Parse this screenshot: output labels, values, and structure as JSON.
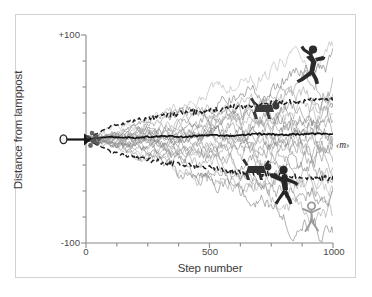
{
  "figure": {
    "border_color": "#d2d2d2",
    "background": "#ffffff"
  },
  "axes": {
    "y_label": "Distance from lamppost",
    "x_label": "Step number",
    "y_ticks": [
      "+100",
      "-100"
    ],
    "x_ticks": [
      "0",
      "500",
      "1000"
    ],
    "y_tick_values": [
      100,
      -100
    ],
    "x_tick_values": [
      0,
      500,
      1000
    ]
  },
  "annotations": {
    "mean_label": "‹m›"
  },
  "icons": {
    "lamppost": "lamppost-icon",
    "jumping_figure": "jumping-person-icon",
    "crawling_figure_upper": "crawling-person-icon",
    "crawling_figure_lower": "crawling-person-icon",
    "walking_figure": "walking-person-icon",
    "stick_figure": "stick-person-icon"
  },
  "caption": {
    "text": ""
  },
  "chart_data": {
    "type": "line",
    "title": "",
    "xlabel": "Step number",
    "ylabel": "Distance from lamppost",
    "xlim": [
      0,
      1000
    ],
    "ylim": [
      -100,
      100
    ],
    "grid": false,
    "legend": null,
    "x_ticks": [
      0,
      500,
      1000
    ],
    "y_ticks": [
      -100,
      100
    ],
    "y_minor_tick_interval": 25,
    "x_minor_tick_interval": 125,
    "series": [
      {
        "name": "mean",
        "style": "solid-black",
        "color": "#141414",
        "x": [
          0,
          100,
          200,
          300,
          400,
          500,
          600,
          700,
          800,
          900,
          1000
        ],
        "values": [
          0,
          2,
          1,
          3,
          2,
          4,
          3,
          5,
          4,
          5,
          5
        ]
      },
      {
        "name": "rms-envelope-upper",
        "style": "dashed-black",
        "color": "#1f1f1f",
        "x": [
          0,
          100,
          200,
          300,
          400,
          500,
          600,
          700,
          800,
          900,
          1000
        ],
        "values": [
          0,
          12,
          18,
          22,
          25,
          28,
          31,
          33,
          35,
          37,
          38
        ]
      },
      {
        "name": "rms-envelope-lower",
        "style": "dashed-black",
        "color": "#1f1f1f",
        "x": [
          0,
          100,
          200,
          300,
          400,
          500,
          600,
          700,
          800,
          900,
          1000
        ],
        "values": [
          0,
          -12,
          -18,
          -22,
          -25,
          -28,
          -31,
          -33,
          -35,
          -37,
          -38
        ]
      },
      {
        "name": "walk-ensemble",
        "style": "thin-gray",
        "color": "#8d8d8d",
        "count": 22,
        "endpoint_range": [
          -95,
          95
        ],
        "note": "individual random-walk trajectories, spread grows as sqrt(n)"
      }
    ],
    "walk_endpoints": [
      92,
      70,
      55,
      48,
      40,
      34,
      28,
      22,
      16,
      10,
      4,
      -3,
      -10,
      -16,
      -22,
      -30,
      -38,
      -46,
      -55,
      -64,
      -78,
      -90
    ]
  }
}
